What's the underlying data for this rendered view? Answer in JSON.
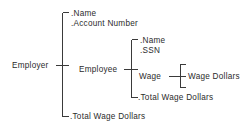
{
  "diagram": {
    "type": "bracket-tree",
    "colors": {
      "background": "#ffffff",
      "text": "#2b2b2b",
      "rule": "#3a3a3a"
    },
    "root": {
      "label": "Employer",
      "children": [
        {
          "label": ".Name"
        },
        {
          "label": ".Account Number"
        },
        {
          "label": "Employee",
          "children": [
            {
              "label": ".Name"
            },
            {
              "label": ".SSN"
            },
            {
              "label": "Wage",
              "children": [
                {
                  "label": "Wage Dollars"
                }
              ]
            },
            {
              "label": ".Total Wage Dollars"
            }
          ]
        },
        {
          "label": ".Total Wage Dollars"
        }
      ]
    },
    "labels": {
      "employer": "Employer",
      "employer_name": ".Name",
      "employer_account_number": ".Account Number",
      "employee": "Employee",
      "employee_name": ".Name",
      "employee_ssn": ".SSN",
      "wage": "Wage",
      "wage_dollars": "Wage Dollars",
      "employee_total_wage_dollars": ".Total Wage Dollars",
      "employer_total_wage_dollars": ".Total Wage Dollars"
    }
  }
}
